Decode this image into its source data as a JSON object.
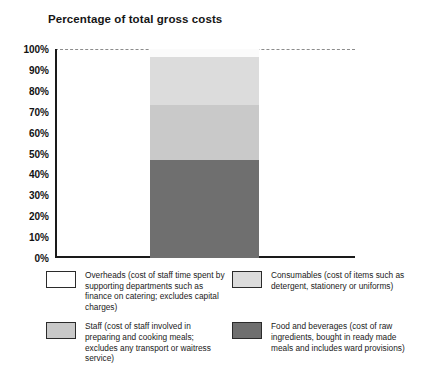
{
  "chart_data": {
    "type": "bar",
    "title": "Percentage of total gross costs",
    "subtitle": "",
    "xlabel": "",
    "ylabel": "",
    "ylim": [
      0,
      100
    ],
    "grid": "dashed gridline at 100% only",
    "legend_position": "below-plot, two columns, two rows",
    "stacked": true,
    "categories": [
      "Total gross costs"
    ],
    "ytick_labels": [
      "100%",
      "90%",
      "80%",
      "70%",
      "60%",
      "50%",
      "40%",
      "30%",
      "20%",
      "10%",
      "0%"
    ],
    "ytick_values": [
      100,
      90,
      80,
      70,
      60,
      50,
      40,
      30,
      20,
      10,
      0
    ],
    "series": [
      {
        "name": "Food and beverages (cost of raw ingredients, bought in ready made meals and includes ward provisions)",
        "short_name": "Food and beverages",
        "values": [
          47
        ],
        "color": "#6f6f6f"
      },
      {
        "name": "Staff (cost of staff involved in preparing and cooking meals; excludes any transport or waitress service)",
        "short_name": "Staff",
        "values": [
          26
        ],
        "color": "#c9c9c9"
      },
      {
        "name": "Consumables (cost of items such as detergent, stationery or uniforms)",
        "short_name": "Consumables",
        "values": [
          23
        ],
        "color": "#dcdcdc"
      },
      {
        "name": "Overheads (cost of staff time spent by supporting departments such as finance on catering; excludes capital charges)",
        "short_name": "Overheads",
        "values": [
          4
        ],
        "color": "#fbfbfb"
      }
    ]
  },
  "legend": {
    "items": [
      {
        "label": "Overheads (cost of staff time spent by supporting departments such as finance on catering; excludes capital charges)",
        "color": "#ffffff",
        "name": "overheads"
      },
      {
        "label": "Consumables (cost of items such as detergent, stationery or uniforms)",
        "color": "#dcdcdc",
        "name": "consumables"
      },
      {
        "label": "Staff (cost of staff involved in preparing and cooking meals; excludes any transport or waitress service)",
        "color": "#c9c9c9",
        "name": "staff"
      },
      {
        "label": "Food and beverages (cost of raw ingredients, bought in ready made meals and includes ward provisions)",
        "color": "#6f6f6f",
        "name": "food-and-beverages"
      }
    ]
  },
  "colors": {
    "axis": "#1a1a1a",
    "gridline": "#8c8c8c",
    "text": "#1a1a1a",
    "background": "#ffffff"
  }
}
